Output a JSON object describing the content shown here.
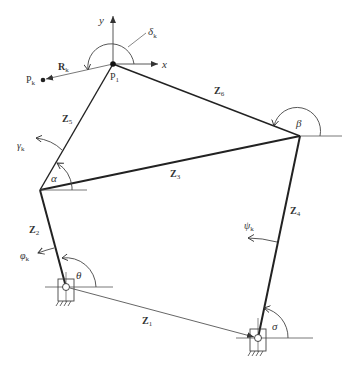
{
  "diagram": {
    "type": "planar-linkage-kinematics",
    "points": {
      "P1": {
        "label": "P",
        "sub": "1",
        "x": 113,
        "y": 64
      },
      "Pk": {
        "label": "P",
        "sub": "k",
        "x": 43,
        "y": 80
      },
      "A": {
        "x": 40,
        "y": 190
      },
      "B": {
        "x": 300,
        "y": 136
      },
      "G1": {
        "x": 66,
        "y": 287
      },
      "G2": {
        "x": 258,
        "y": 338
      }
    },
    "axes": {
      "x_label": "x",
      "y_label": "y"
    },
    "links": [
      {
        "id": "Z1",
        "label": "Z",
        "sub": "1",
        "from": "G1",
        "to": "G2",
        "style": "thin"
      },
      {
        "id": "Z2",
        "label": "Z",
        "sub": "2",
        "from": "G1",
        "to": "A",
        "style": "thick"
      },
      {
        "id": "Z3",
        "label": "Z",
        "sub": "3",
        "from": "A",
        "to": "B",
        "style": "thick"
      },
      {
        "id": "Z4",
        "label": "Z",
        "sub": "4",
        "from": "G2",
        "to": "B",
        "style": "thick"
      },
      {
        "id": "Z5",
        "label": "Z",
        "sub": "5",
        "from": "A",
        "to": "P1",
        "style": "medium"
      },
      {
        "id": "Z6",
        "label": "Z",
        "sub": "6",
        "from": "P1",
        "to": "B",
        "style": "medium"
      },
      {
        "id": "Rk",
        "label": "R",
        "sub": "k",
        "from": "P1",
        "to": "Pk",
        "style": "thin"
      }
    ],
    "angles": {
      "delta": {
        "symbol": "δ",
        "sub": "k"
      },
      "gamma": {
        "symbol": "γ",
        "sub": "k"
      },
      "alpha": {
        "symbol": "α",
        "sub": ""
      },
      "beta": {
        "symbol": "β",
        "sub": ""
      },
      "phi": {
        "symbol": "φ",
        "sub": "k"
      },
      "theta": {
        "symbol": "θ",
        "sub": ""
      },
      "psi": {
        "symbol": "ψ",
        "sub": "k"
      },
      "sigma": {
        "symbol": "σ",
        "sub": ""
      }
    },
    "colors": {
      "line": "#222222",
      "thin_line": "#555555",
      "text": "#333333",
      "background": "#ffffff"
    }
  }
}
